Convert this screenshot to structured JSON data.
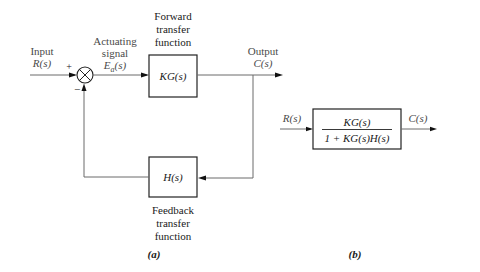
{
  "diagram": {
    "panel_a": {
      "caption": "(a)",
      "input_label": "Input",
      "input_signal": "R(s)",
      "plus_sign": "+",
      "minus_sign": "−",
      "actuating_label_line1": "Actuating",
      "actuating_label_line2": "signal",
      "actuating_signal": "E",
      "actuating_subscript": "a",
      "actuating_suffix": "(s)",
      "forward_label_line1": "Forward",
      "forward_label_line2": "transfer",
      "forward_label_line3": "function",
      "forward_block": "KG(s)",
      "output_label": "Output",
      "output_signal": "C(s)",
      "feedback_block": "H(s)",
      "feedback_label_line1": "Feedback",
      "feedback_label_line2": "transfer",
      "feedback_label_line3": "function"
    },
    "panel_b": {
      "caption": "(b)",
      "input_signal": "R(s)",
      "numerator": "KG(s)",
      "denominator": "1 + KG(s)H(s)",
      "output_signal": "C(s)"
    }
  }
}
